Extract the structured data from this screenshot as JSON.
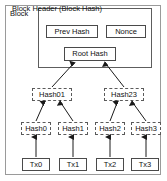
{
  "diagram": {
    "outer_label": "Block",
    "header": {
      "title": "Block Header (Block Hash)",
      "fields": [
        {
          "label": "Prev Hash"
        },
        {
          "label": "Nonce"
        },
        {
          "label": "Root Hash"
        }
      ]
    },
    "merkle": {
      "level1": [
        {
          "label": "Hash01"
        },
        {
          "label": "Hash23"
        }
      ],
      "level0": [
        {
          "label": "Hash0"
        },
        {
          "label": "Hash1"
        },
        {
          "label": "Hash2"
        },
        {
          "label": "Hash3"
        }
      ],
      "transactions": [
        {
          "label": "Tx0"
        },
        {
          "label": "Tx1"
        },
        {
          "label": "Tx2"
        },
        {
          "label": "Tx3"
        }
      ]
    },
    "colors": {
      "outer_border": "#9a9a9a",
      "header_border": "#5d5d5d",
      "node_border_solid": "#4a4a4a",
      "node_border_dashed": "#5a5a5a",
      "arrow": "#1a1a1a",
      "background": "#ffffff",
      "text": "#111111"
    }
  }
}
